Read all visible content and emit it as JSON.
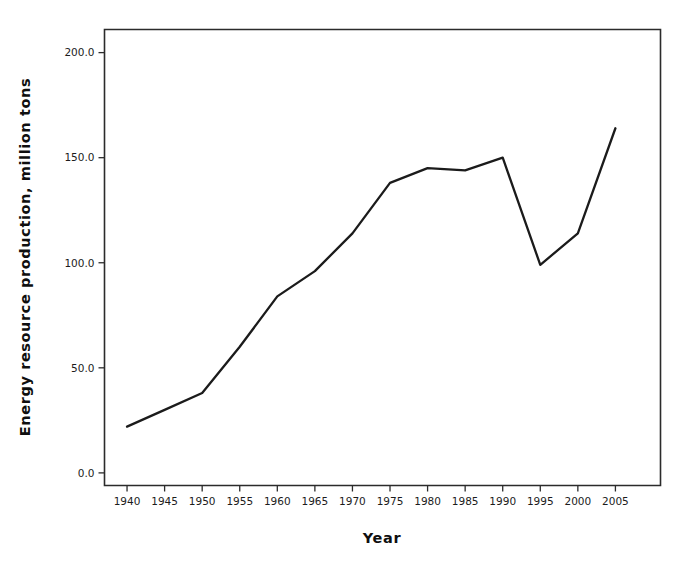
{
  "chart_data": {
    "type": "line",
    "title": "",
    "xlabel": "Year",
    "ylabel": "Energy resource production, million tons",
    "x": [
      1940,
      1945,
      1950,
      1955,
      1960,
      1965,
      1970,
      1975,
      1980,
      1985,
      1990,
      1995,
      2000,
      2005
    ],
    "values": [
      22,
      30,
      38,
      60,
      84,
      96,
      114,
      138,
      145,
      144,
      150,
      99,
      114,
      164
    ],
    "series": [
      {
        "name": "Energy resource production",
        "values": [
          22,
          30,
          38,
          60,
          84,
          96,
          114,
          138,
          145,
          144,
          150,
          99,
          114,
          164
        ],
        "color": "#1b1b1b"
      }
    ],
    "xlim": [
      1937.0,
      2011.0
    ],
    "ylim": [
      -6.0,
      211.0
    ],
    "x_ticks": [
      1940,
      1945,
      1950,
      1955,
      1960,
      1965,
      1970,
      1975,
      1980,
      1985,
      1990,
      1995,
      2000,
      2005
    ],
    "x_tick_labels": [
      "1940",
      "1945",
      "1950",
      "1955",
      "1960",
      "1965",
      "1970",
      "1975",
      "1980",
      "1985",
      "1990",
      "1995",
      "2000",
      "2005"
    ],
    "y_ticks": [
      0.0,
      50.0,
      100.0,
      150.0,
      200.0
    ],
    "y_tick_labels": [
      "0.0",
      "50.0",
      "100.0",
      "150.0",
      "200.0"
    ],
    "grid": false,
    "legend": null,
    "legend_position": "none",
    "annotations": [],
    "frame_color": "#2b2b2b",
    "background_color": "#ffffff"
  },
  "axes": {
    "x_title": "Year",
    "y_title": "Energy resource production, million tons"
  }
}
